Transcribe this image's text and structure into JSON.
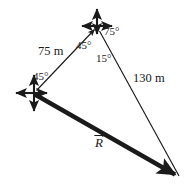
{
  "figure": {
    "type": "vector-triangle-diagram",
    "title": "",
    "background_color": "#ffffff",
    "stroke_color": "#1a1a1a",
    "width": 194,
    "height": 187
  },
  "vertices": {
    "left": {
      "name": "left-origin-vertex",
      "x": 34,
      "y": 93
    },
    "top": {
      "name": "top-vertex",
      "x": 97,
      "y": 26
    },
    "bottom_right": {
      "name": "bottom-right-vertex",
      "x": 180,
      "y": 178
    }
  },
  "vectors": [
    {
      "id": "vector-75m",
      "label": "75 m",
      "from": "left",
      "to": "top",
      "style": "thin-arrow",
      "label_x": 38,
      "label_y": 45
    },
    {
      "id": "vector-130m",
      "label": "130 m",
      "from": "top",
      "to": "bottom_right",
      "style": "thin-line",
      "label_x": 133,
      "label_y": 72
    },
    {
      "id": "vector-resultant",
      "label": "R",
      "accent": "vector-arrow-overbar",
      "from": "left",
      "to": "bottom_right",
      "style": "thick-arrow",
      "label_x": 95,
      "label_y": 135
    }
  ],
  "angles": [
    {
      "id": "angle-top-left",
      "label": "45°",
      "x": 76,
      "y": 40,
      "at_vertex": "top"
    },
    {
      "id": "angle-top-right",
      "label": "75°",
      "x": 104,
      "y": 26,
      "at_vertex": "top"
    },
    {
      "id": "angle-top-below",
      "label": "15°",
      "x": 96,
      "y": 53,
      "at_vertex": "top"
    },
    {
      "id": "angle-left",
      "label": "45°",
      "x": 33,
      "y": 71,
      "at_vertex": "left"
    }
  ],
  "axis_crosses": [
    {
      "id": "axis-cross-top",
      "center_x": 97,
      "center_y": 26,
      "arm_left": 18,
      "arm_right": 18,
      "arm_up": 20,
      "arm_down": 11
    },
    {
      "id": "axis-cross-left",
      "center_x": 34,
      "center_y": 93,
      "arm_left": 21,
      "arm_right": 16,
      "arm_up": 21,
      "arm_down": 21
    }
  ]
}
